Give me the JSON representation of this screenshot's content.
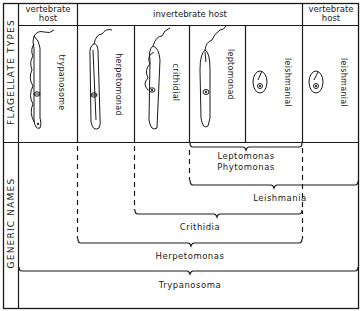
{
  "row_labels": {
    "flagellate_types": "FLAGELLATE TYPES",
    "generic_names": "GENERIC NAMES"
  },
  "header": {
    "left_host": "vertebrate host",
    "middle_host": "invertebrate host",
    "right_host": "vertebrate host"
  },
  "flagellate_types": [
    {
      "label": "trypanosome",
      "host": "vertebrate host"
    },
    {
      "label": "herpetomonad",
      "host": "invertebrate host"
    },
    {
      "label": "crithidial",
      "host": "invertebrate host"
    },
    {
      "label": "leptomonad",
      "host": "invertebrate host"
    },
    {
      "label": "leishmanial",
      "host": "invertebrate host"
    },
    {
      "label": "leishmanial",
      "host": "vertebrate host"
    }
  ],
  "generic_names": [
    {
      "name_line1": "Leptomonas",
      "name_line2": "Phytomonas",
      "includes": [
        "leptomonad",
        "leishmanial"
      ]
    },
    {
      "name": "Leishmania",
      "includes": [
        "leptomonad",
        "leishmanial",
        "leishmanial (vertebrate)"
      ]
    },
    {
      "name": "Crithidia",
      "includes": [
        "crithidial",
        "leptomonad",
        "leishmanial"
      ]
    },
    {
      "name": "Herpetomonas",
      "includes": [
        "herpetomonad",
        "crithidial",
        "leptomonad",
        "leishmanial"
      ]
    },
    {
      "name": "Trypanosoma",
      "includes": [
        "trypanosome",
        "herpetomonad",
        "crithidial",
        "leptomonad",
        "leishmanial",
        "leishmanial (vertebrate)"
      ]
    }
  ]
}
